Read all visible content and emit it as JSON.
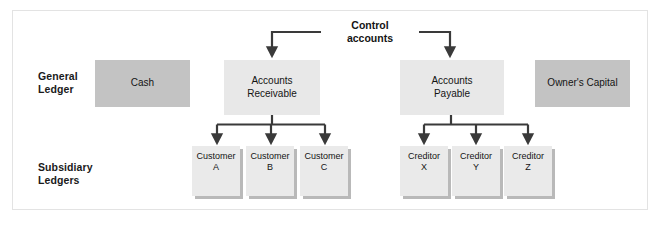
{
  "figure": {
    "colors": {
      "frame_border": "#e3e3e3",
      "background": "#ffffff",
      "box_dark_gray": "#c3c3c3",
      "box_light_gray": "#e8e8e8",
      "card_face": "#eaeaea",
      "card_shadow": "#b9b9b9",
      "connector": "#3a3a3a",
      "text": "#141414"
    }
  },
  "rows": {
    "general_ledger_label": "General\nLedger",
    "subsidiary_ledgers_label": "Subsidiary\nLedgers"
  },
  "control": {
    "label": "Control\naccounts"
  },
  "general_ledger": {
    "accounts": [
      {
        "name": "cash",
        "label": "Cash",
        "tone": "dark"
      },
      {
        "name": "accounts-receivable",
        "label": "Accounts\nReceivable",
        "tone": "light"
      },
      {
        "name": "accounts-payable",
        "label": "Accounts\nPayable",
        "tone": "light"
      },
      {
        "name": "owners-capital",
        "label": "Owner's Capital",
        "tone": "dark"
      }
    ]
  },
  "subsidiary_ledgers": {
    "accounts_receivable_cards": [
      {
        "name": "customer-a",
        "label": "Customer\nA"
      },
      {
        "name": "customer-b",
        "label": "Customer\nB"
      },
      {
        "name": "customer-c",
        "label": "Customer\nC"
      }
    ],
    "accounts_payable_cards": [
      {
        "name": "creditor-x",
        "label": "Creditor\nX"
      },
      {
        "name": "creditor-y",
        "label": "Creditor\nY"
      },
      {
        "name": "creditor-z",
        "label": "Creditor\nZ"
      }
    ]
  }
}
